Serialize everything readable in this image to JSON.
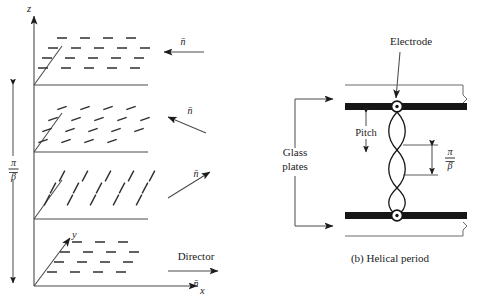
{
  "figure": {
    "panel_a": {
      "axes": {
        "z_label": "z",
        "y_label": "y",
        "x_label": "x"
      },
      "period_label": {
        "numerator": "π",
        "denominator": "β",
        "full": "π/β"
      },
      "layers": [
        {
          "index": 0,
          "name": "layer-top",
          "director_label": "n̄",
          "director_angle_deg": 180,
          "dash_angle_deg": 0
        },
        {
          "index": 1,
          "name": "layer-second",
          "director_label": "n̄",
          "director_angle_deg": 155,
          "dash_angle_deg": -20
        },
        {
          "index": 2,
          "name": "layer-third",
          "director_label": "n̄",
          "director_angle_deg": 35,
          "dash_angle_deg": -62
        },
        {
          "index": 3,
          "name": "layer-bottom",
          "director_label": "n̄",
          "director_angle_deg": 0,
          "dash_angle_deg": 0
        }
      ],
      "director_caption": "Director",
      "director_symbol": "n̄"
    },
    "panel_b": {
      "caption": "(b)  Helical period",
      "electrode_label": "Electrode",
      "glass_plates_label_line1": "Glass",
      "glass_plates_label_line2": "plates",
      "pitch_label": "Pitch",
      "period_label": {
        "numerator": "π",
        "denominator": "β",
        "full": "π/β"
      },
      "helix_turns": 3
    },
    "colors": {
      "ink": "#1c1c1c",
      "line": "#4a4a4a",
      "electrode_fill": "#161616",
      "background": "#ffffff"
    }
  }
}
